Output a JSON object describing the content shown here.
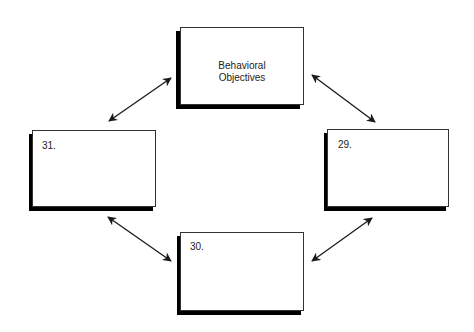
{
  "diagram": {
    "type": "cycle",
    "boxes": {
      "top": {
        "line1": "Behavioral",
        "line2": "Objectives"
      },
      "right": {
        "label": "29."
      },
      "bottom": {
        "label": "30."
      },
      "left": {
        "label": "31."
      }
    },
    "arrows": [
      {
        "from": "left",
        "to": "top",
        "bidirectional": true
      },
      {
        "from": "top",
        "to": "right",
        "bidirectional": true
      },
      {
        "from": "right",
        "to": "bottom",
        "bidirectional": true
      },
      {
        "from": "bottom",
        "to": "left",
        "bidirectional": true
      }
    ],
    "colors": {
      "stroke": "#1a1a1a",
      "shadow": "#000000",
      "fill": "#ffffff"
    }
  }
}
